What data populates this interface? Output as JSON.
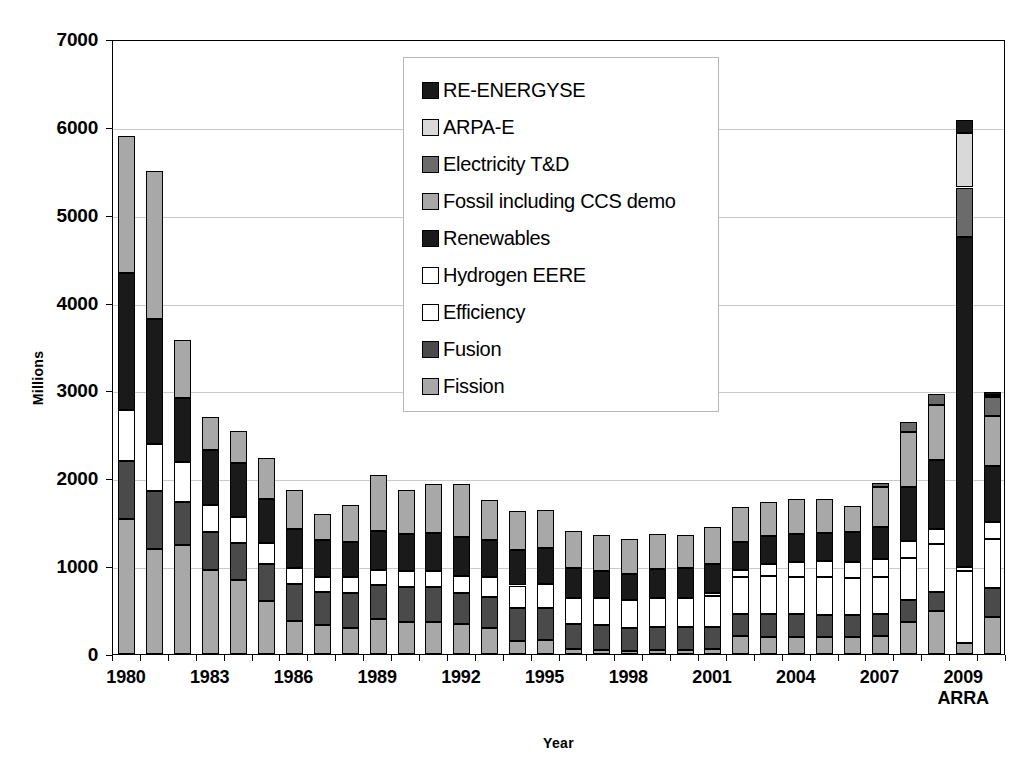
{
  "chart_data": {
    "type": "bar",
    "stacked": true,
    "title": "",
    "xlabel": "Year",
    "ylabel": "Millions",
    "ylim": [
      0,
      7000
    ],
    "ytick_values": [
      0,
      1000,
      2000,
      3000,
      4000,
      5000,
      6000,
      7000
    ],
    "ytick_labels": [
      "0",
      "1000",
      "2000",
      "3000",
      "4000",
      "5000",
      "6000",
      "7000"
    ],
    "grid": true,
    "legend_position": "upper-center",
    "categories": [
      "1980",
      "1981",
      "1982",
      "1983",
      "1984",
      "1985",
      "1986",
      "1987",
      "1988",
      "1989",
      "1990",
      "1991",
      "1992",
      "1993",
      "1994",
      "1995",
      "1996",
      "1997",
      "1998",
      "1999",
      "2000",
      "2001",
      "2002",
      "2003",
      "2004",
      "2005",
      "2006",
      "2007",
      "2008",
      "2009",
      "ARRA",
      "2010"
    ],
    "xtick_labels": [
      {
        "category": "1980",
        "line1": "1980",
        "line2": ""
      },
      {
        "category": "1983",
        "line1": "1983",
        "line2": ""
      },
      {
        "category": "1986",
        "line1": "1986",
        "line2": ""
      },
      {
        "category": "1989",
        "line1": "1989",
        "line2": ""
      },
      {
        "category": "1992",
        "line1": "1992",
        "line2": ""
      },
      {
        "category": "1995",
        "line1": "1995",
        "line2": ""
      },
      {
        "category": "1998",
        "line1": "1998",
        "line2": ""
      },
      {
        "category": "2001",
        "line1": "2001",
        "line2": ""
      },
      {
        "category": "2004",
        "line1": "2004",
        "line2": ""
      },
      {
        "category": "2007",
        "line1": "2007",
        "line2": ""
      },
      {
        "category": "ARRA",
        "line1": "2009",
        "line2": "ARRA"
      }
    ],
    "series": [
      {
        "name": "Fission",
        "color": "#a8a8a8",
        "values": [
          1540,
          1200,
          1240,
          960,
          840,
          600,
          380,
          330,
          300,
          400,
          370,
          370,
          340,
          300,
          150,
          165,
          60,
          50,
          40,
          45,
          50,
          55,
          200,
          195,
          195,
          190,
          190,
          200,
          370,
          490,
          120,
          420
        ]
      },
      {
        "name": "Fusion",
        "color": "#4a4a4a",
        "values": [
          660,
          660,
          490,
          430,
          420,
          420,
          420,
          380,
          400,
          380,
          390,
          390,
          350,
          350,
          370,
          355,
          280,
          280,
          260,
          260,
          260,
          255,
          260,
          260,
          255,
          255,
          255,
          260,
          245,
          220,
          0,
          330
        ]
      },
      {
        "name": "Efficiency",
        "color": "#ffffff",
        "values": [
          580,
          530,
          450,
          310,
          300,
          245,
          180,
          170,
          180,
          180,
          180,
          180,
          200,
          230,
          260,
          280,
          300,
          310,
          310,
          330,
          330,
          350,
          420,
          430,
          430,
          430,
          420,
          420,
          480,
          540,
          820,
          560
        ]
      },
      {
        "name": "Hydrogen EERE",
        "color": "#ffffff",
        "values": [
          0,
          0,
          0,
          0,
          0,
          0,
          0,
          0,
          0,
          0,
          0,
          0,
          0,
          0,
          0,
          0,
          0,
          0,
          0,
          0,
          0,
          30,
          80,
          140,
          170,
          180,
          180,
          200,
          190,
          170,
          50,
          190
        ]
      },
      {
        "name": "Renewables",
        "color": "#1a1a1a",
        "values": [
          1560,
          1420,
          730,
          620,
          610,
          500,
          440,
          420,
          400,
          440,
          430,
          440,
          440,
          420,
          400,
          410,
          340,
          310,
          300,
          330,
          340,
          340,
          320,
          320,
          320,
          320,
          340,
          370,
          620,
          790,
          3760,
          640
        ]
      },
      {
        "name": "Fossil including CCS demo",
        "color": "#a8a8a8",
        "values": [
          1560,
          1690,
          660,
          380,
          370,
          465,
          450,
          290,
          420,
          640,
          500,
          550,
          600,
          450,
          450,
          430,
          420,
          410,
          400,
          400,
          370,
          420,
          390,
          390,
          390,
          390,
          300,
          450,
          620,
          620,
          0,
          570
        ]
      },
      {
        "name": "Electricity T&D",
        "color": "#6b6b6b",
        "values": [
          0,
          0,
          0,
          0,
          0,
          0,
          0,
          0,
          0,
          0,
          0,
          0,
          0,
          0,
          0,
          0,
          0,
          0,
          0,
          0,
          0,
          0,
          0,
          0,
          0,
          0,
          0,
          50,
          120,
          130,
          560,
          220
        ]
      },
      {
        "name": "ARPA-E",
        "color": "#d9d9d9",
        "values": [
          0,
          0,
          0,
          0,
          0,
          0,
          0,
          0,
          0,
          0,
          0,
          0,
          0,
          0,
          0,
          0,
          0,
          0,
          0,
          0,
          0,
          0,
          0,
          0,
          0,
          0,
          0,
          0,
          0,
          0,
          620,
          20
        ]
      },
      {
        "name": "RE-ENERGYSE",
        "color": "#1a1a1a",
        "values": [
          0,
          0,
          0,
          0,
          0,
          0,
          0,
          0,
          0,
          0,
          0,
          0,
          0,
          0,
          0,
          0,
          0,
          0,
          0,
          0,
          0,
          0,
          0,
          0,
          0,
          0,
          0,
          0,
          0,
          0,
          150,
          30
        ]
      }
    ],
    "legend_entries": [
      {
        "label": "RE-ENERGYSE",
        "color": "#1a1a1a"
      },
      {
        "label": "ARPA-E",
        "color": "#d9d9d9"
      },
      {
        "label": "Electricity T&D",
        "color": "#6b6b6b"
      },
      {
        "label": "Fossil including CCS demo",
        "color": "#a8a8a8"
      },
      {
        "label": "Renewables",
        "color": "#1a1a1a"
      },
      {
        "label": "Hydrogen EERE",
        "color": "#ffffff"
      },
      {
        "label": "Efficiency",
        "color": "#ffffff"
      },
      {
        "label": "Fusion",
        "color": "#4a4a4a"
      },
      {
        "label": "Fission",
        "color": "#a8a8a8"
      }
    ]
  }
}
